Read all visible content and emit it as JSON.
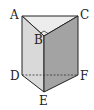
{
  "figure": {
    "type": "triangular-prism",
    "vertices": {
      "A": {
        "label": "A",
        "x": 22,
        "y": 16
      },
      "B": {
        "label": "B",
        "x": 44,
        "y": 36
      },
      "C": {
        "label": "C",
        "x": 78,
        "y": 16
      },
      "D": {
        "label": "D",
        "x": 22,
        "y": 75
      },
      "E": {
        "label": "E",
        "x": 44,
        "y": 92
      },
      "F": {
        "label": "F",
        "x": 78,
        "y": 75
      }
    },
    "hidden_edge": "DF",
    "colors": {
      "top_face": "#ececec",
      "left_face": "#d9d9d9",
      "right_face": "#a3a3a3",
      "edge": "#222222"
    }
  }
}
